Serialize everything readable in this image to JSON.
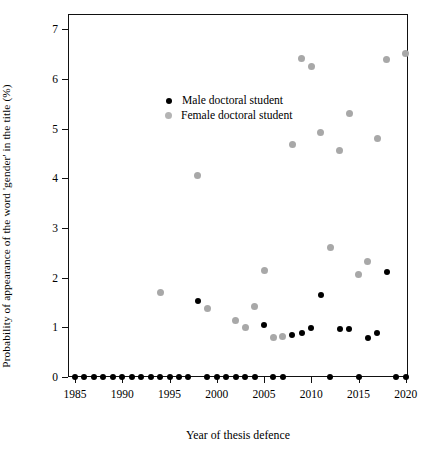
{
  "chart_data": {
    "type": "scatter",
    "title": "",
    "xlabel": "Year of thesis defence",
    "ylabel": "Probability of appearance of the word 'gender' in the title (%)",
    "xlim": [
      1983.8,
      2021.2
    ],
    "ylim": [
      -0.32,
      7.3
    ],
    "xticks": [
      1985,
      1990,
      1995,
      2000,
      2005,
      2010,
      2015,
      2020
    ],
    "yticks": [
      0,
      1,
      2,
      3,
      4,
      5,
      6,
      7
    ],
    "grid": false,
    "legend_position": "top-left",
    "series": [
      {
        "name": "Male doctoral student",
        "color": "#000000",
        "points": [
          {
            "x": 1985,
            "y": 0
          },
          {
            "x": 1986,
            "y": 0
          },
          {
            "x": 1987,
            "y": 0
          },
          {
            "x": 1988,
            "y": 0
          },
          {
            "x": 1989,
            "y": 0
          },
          {
            "x": 1990,
            "y": 0
          },
          {
            "x": 1991,
            "y": 0
          },
          {
            "x": 1992,
            "y": 0
          },
          {
            "x": 1993,
            "y": 0
          },
          {
            "x": 1994,
            "y": 0
          },
          {
            "x": 1995,
            "y": 0
          },
          {
            "x": 1996,
            "y": 0
          },
          {
            "x": 1997,
            "y": 0
          },
          {
            "x": 1998,
            "y": 1.52
          },
          {
            "x": 1999,
            "y": 0
          },
          {
            "x": 2000,
            "y": 0
          },
          {
            "x": 2001,
            "y": 0
          },
          {
            "x": 2002,
            "y": 0
          },
          {
            "x": 2003,
            "y": 0
          },
          {
            "x": 2004,
            "y": 0
          },
          {
            "x": 2005,
            "y": 1.05
          },
          {
            "x": 2006,
            "y": 0
          },
          {
            "x": 2007,
            "y": 0
          },
          {
            "x": 2008,
            "y": 0.84
          },
          {
            "x": 2009,
            "y": 0.88
          },
          {
            "x": 2010,
            "y": 0.98
          },
          {
            "x": 2011,
            "y": 1.64
          },
          {
            "x": 2012,
            "y": 0
          },
          {
            "x": 2013,
            "y": 0.96
          },
          {
            "x": 2014,
            "y": 0.97
          },
          {
            "x": 2015,
            "y": 0
          },
          {
            "x": 2016,
            "y": 0.79
          },
          {
            "x": 2017,
            "y": 0.88
          },
          {
            "x": 2018,
            "y": 2.12
          },
          {
            "x": 2019,
            "y": 0
          },
          {
            "x": 2020,
            "y": 0
          }
        ]
      },
      {
        "name": "Female doctoral student",
        "color": "#a8a8a8",
        "points": [
          {
            "x": 1994,
            "y": 1.7
          },
          {
            "x": 1998,
            "y": 4.05
          },
          {
            "x": 1999,
            "y": 1.37
          },
          {
            "x": 2002,
            "y": 1.13
          },
          {
            "x": 2003,
            "y": 1.0
          },
          {
            "x": 2004,
            "y": 1.42
          },
          {
            "x": 2005,
            "y": 2.14
          },
          {
            "x": 2006,
            "y": 0.79
          },
          {
            "x": 2007,
            "y": 0.81
          },
          {
            "x": 2008,
            "y": 4.68
          },
          {
            "x": 2009,
            "y": 6.4
          },
          {
            "x": 2010,
            "y": 6.25
          },
          {
            "x": 2011,
            "y": 4.92
          },
          {
            "x": 2012,
            "y": 2.6
          },
          {
            "x": 2013,
            "y": 4.55
          },
          {
            "x": 2014,
            "y": 5.3
          },
          {
            "x": 2015,
            "y": 2.07
          },
          {
            "x": 2016,
            "y": 2.32
          },
          {
            "x": 2017,
            "y": 4.8
          },
          {
            "x": 2018,
            "y": 6.38
          },
          {
            "x": 2020,
            "y": 6.5
          }
        ]
      }
    ],
    "legend": [
      {
        "label": "Male doctoral student",
        "marker": "male-dot-marker"
      },
      {
        "label": "Female doctoral student",
        "marker": "female-dot-marker"
      }
    ]
  }
}
